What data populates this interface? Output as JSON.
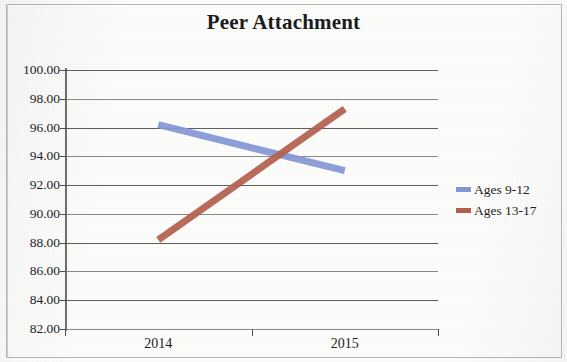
{
  "chart_data": {
    "type": "line",
    "title": "Peer Attachment",
    "xlabel": "",
    "ylabel": "",
    "categories": [
      "2014",
      "2015"
    ],
    "series": [
      {
        "name": "Ages 9-12",
        "values": [
          96.2,
          93.0
        ],
        "color": "#8497d6"
      },
      {
        "name": "Ages 13-17",
        "values": [
          88.2,
          97.3
        ],
        "color": "#b4604e"
      }
    ],
    "ylim": [
      82.0,
      100.0
    ],
    "ytick_step": 2.0,
    "ytick_labels": [
      "100.00",
      "98.00",
      "96.00",
      "94.00",
      "92.00",
      "90.00",
      "88.00",
      "86.00",
      "84.00",
      "82.00"
    ],
    "ytick_values": [
      100,
      98,
      96,
      94,
      92,
      90,
      88,
      86,
      84,
      82
    ],
    "grid": true,
    "legend_position": "right"
  },
  "legend": {
    "items": [
      {
        "label": "Ages 9-12",
        "color": "#8497d6"
      },
      {
        "label": "Ages 13-17",
        "color": "#b4604e"
      }
    ]
  }
}
